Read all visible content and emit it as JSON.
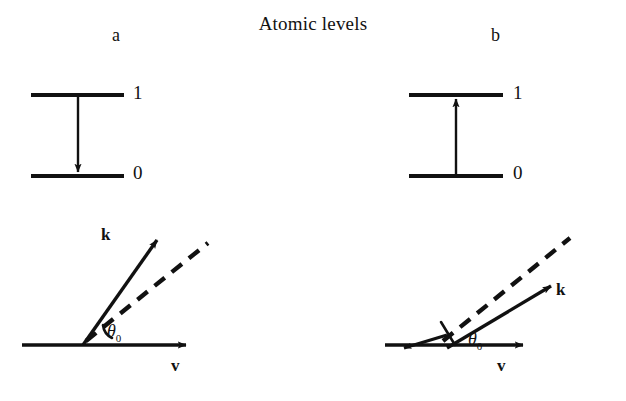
{
  "figure": {
    "title": "Atomic levels",
    "background_color": "#ffffff",
    "ink_color": "#111111",
    "width": 626,
    "height": 401
  },
  "panels": [
    {
      "letter": "a",
      "process": "emission",
      "level_diagram": {
        "upper_level_label": "1",
        "lower_level_label": "0",
        "transition_arrow_direction": "down"
      },
      "vector_diagram": {
        "k_label": "k",
        "v_label": "v",
        "angle_label": "θ",
        "angle_subscript": "0",
        "k_angle_deg": 55,
        "dashed_angle_deg": 35,
        "k_relative_to_dashed": "steeper"
      }
    },
    {
      "letter": "b",
      "process": "absorption",
      "level_diagram": {
        "upper_level_label": "1",
        "lower_level_label": "0",
        "transition_arrow_direction": "up"
      },
      "vector_diagram": {
        "k_label": "k",
        "v_label": "v",
        "angle_label": "θ",
        "angle_subscript": "0",
        "k_angle_deg": 20,
        "dashed_angle_deg": 40,
        "k_relative_to_dashed": "shallower"
      }
    }
  ]
}
